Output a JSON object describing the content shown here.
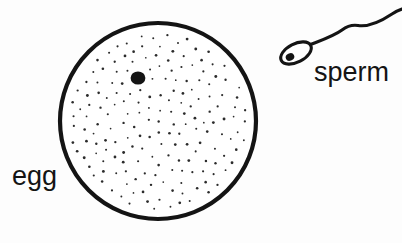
{
  "figure": {
    "kind": "biology-line-drawing",
    "background_color": "#fdfdfd",
    "ink_color": "#141414"
  },
  "labels": {
    "egg": "egg",
    "sperm": "sperm"
  },
  "egg": {
    "name": "egg-cell",
    "shape": "circle",
    "center_x": 158,
    "center_y": 121,
    "radius": 100,
    "outline_color": "#141414",
    "outline_width": 4,
    "fill_color": "#ffffff",
    "cytoplasm_texture": "stipple",
    "stipple_dot_color": "#2b2b2b",
    "stipple_dot_radius": 1.0,
    "stipple_count": 190,
    "nucleus": {
      "name": "egg-nucleus",
      "center_x": 138,
      "center_y": 78,
      "radius": 7,
      "fill_color": "#141414"
    }
  },
  "sperm": {
    "name": "sperm-cell",
    "head": {
      "center_x": 297,
      "center_y": 52,
      "length": 30,
      "width": 16,
      "rotation_deg": -28,
      "outline_color": "#141414",
      "outline_width": 3,
      "fill_color": "#ffffff"
    },
    "nucleus": {
      "name": "sperm-nucleus",
      "center_x": 291,
      "center_y": 56,
      "radius": 4,
      "fill_color": "#141414"
    },
    "tail": {
      "name": "sperm-tail",
      "stroke_color": "#141414",
      "path_points": "from head midpiece, rises right with an S-curve to the right image edge",
      "start_x": 308,
      "start_y": 45,
      "end_x": 402,
      "end_y": 11
    }
  }
}
